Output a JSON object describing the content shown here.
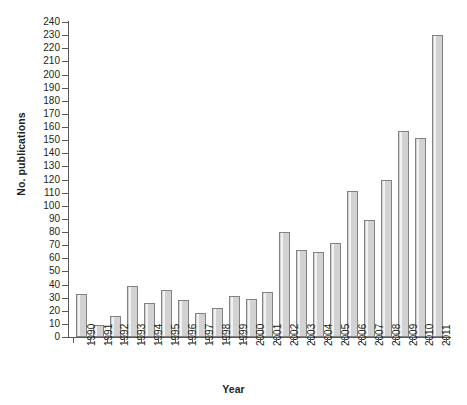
{
  "chart_data": {
    "type": "bar",
    "title": "",
    "xlabel": "Year",
    "ylabel": "No. publications",
    "categories": [
      "1990",
      "1991",
      "1992",
      "1993",
      "1994",
      "1995",
      "1996",
      "1997",
      "1998",
      "1999",
      "2000",
      "2001",
      "2002",
      "2003",
      "2004",
      "2005",
      "2006",
      "2007",
      "2008",
      "2009",
      "2010",
      "2011"
    ],
    "values": [
      33,
      9,
      16,
      39,
      26,
      36,
      28,
      18,
      22,
      31,
      29,
      34,
      80,
      66,
      65,
      72,
      111,
      89,
      120,
      157,
      152,
      230
    ],
    "ylim": [
      0,
      240
    ],
    "ytick_step": 10,
    "yticks": [
      0,
      10,
      20,
      30,
      40,
      50,
      60,
      70,
      80,
      90,
      100,
      110,
      120,
      130,
      140,
      150,
      160,
      170,
      180,
      190,
      200,
      210,
      220,
      230,
      240
    ],
    "grid": false,
    "legend": "none",
    "series": [
      {
        "name": "No. publications",
        "values": [
          33,
          9,
          16,
          39,
          26,
          36,
          28,
          18,
          22,
          31,
          29,
          34,
          80,
          66,
          65,
          72,
          111,
          89,
          120,
          157,
          152,
          230
        ]
      }
    ],
    "bar_fill_color": "#d2d2d2",
    "bar_border_color": "#808285",
    "axis_color": "#58595b",
    "background_color": "#ffffff"
  }
}
